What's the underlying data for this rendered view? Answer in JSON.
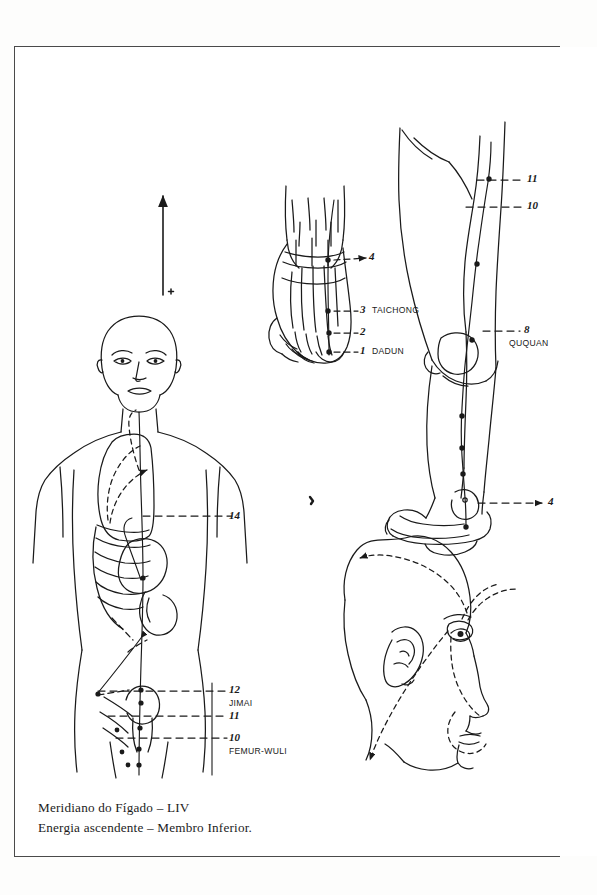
{
  "plate": {
    "title": "Meridiano do Fígado – LIV",
    "subtitle": "Energia ascendente – Membro Inferior.",
    "border_color": "#4a4a4a",
    "ink_color": "#1a1a1a",
    "background": "#ffffff"
  },
  "caption": {
    "line_1": "Meridiano do Fígado – LIV",
    "line_2": "Energia ascendente – Membro Inferior."
  },
  "figures": {
    "torso": {
      "name": "anterior-torso",
      "description": "Front view of head and trunk with lung and liver outlines, ribs and ascending meridian"
    },
    "foot_dorsum": {
      "name": "foot-dorsum",
      "description": "Dorsal view of foot skeleton with metatarsals"
    },
    "leg_medial": {
      "name": "leg-medial",
      "description": "Medial view of leg and foot with meridian pathway"
    },
    "head_profile": {
      "name": "head-profile",
      "description": "Lateral view of head with dashed facial branches"
    }
  },
  "direction_arrow": {
    "label": "ascending-energy-arrow",
    "marker": "*"
  },
  "points": {
    "foot_dorsum": [
      {
        "id": "4",
        "name": ""
      },
      {
        "id": "3",
        "name": "TAICHONG"
      },
      {
        "id": "2",
        "name": ""
      },
      {
        "id": "1",
        "name": "DADUN"
      }
    ],
    "leg_medial": [
      {
        "id": "11",
        "name": ""
      },
      {
        "id": "10",
        "name": ""
      },
      {
        "id": "8",
        "name": "QUQUAN"
      },
      {
        "id": "4",
        "name": ""
      }
    ],
    "torso": [
      {
        "id": "14",
        "name": ""
      },
      {
        "id": "12",
        "name": "JIMAI"
      },
      {
        "id": "11",
        "name": ""
      },
      {
        "id": "10",
        "name": "FEMUR-WULI"
      }
    ]
  }
}
